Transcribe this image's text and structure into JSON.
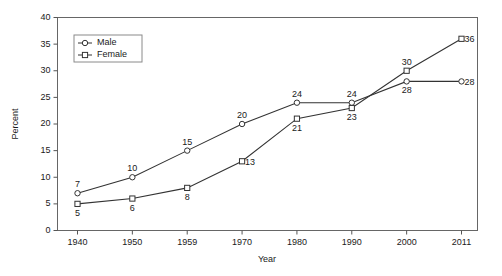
{
  "chart_data": {
    "type": "line",
    "title": "",
    "xlabel": "Year",
    "ylabel": "Percent",
    "categories": [
      "1940",
      "1950",
      "1959",
      "1970",
      "1980",
      "1990",
      "2000",
      "2011"
    ],
    "ylim": [
      0,
      40
    ],
    "yticks": [
      0,
      5,
      10,
      15,
      20,
      25,
      30,
      35,
      40
    ],
    "ytick_labels": [
      "0",
      "5",
      "10",
      "15",
      "20",
      "25",
      "30",
      "35",
      "40"
    ],
    "grid": false,
    "legend_position": "top-left",
    "series": [
      {
        "name": "Male",
        "marker": "circle",
        "values": [
          7,
          10,
          15,
          20,
          24,
          24,
          28,
          28
        ],
        "point_labels": [
          "7",
          "10",
          "15",
          "20",
          "24",
          "24",
          "28",
          "28"
        ],
        "label_side": [
          "above",
          "above",
          "above",
          "above",
          "above",
          "above",
          "below",
          "right"
        ]
      },
      {
        "name": "Female",
        "marker": "square",
        "values": [
          5,
          6,
          8,
          13,
          21,
          23,
          30,
          36
        ],
        "point_labels": [
          "5",
          "6",
          "8",
          "13",
          "21",
          "23",
          "30",
          "36"
        ],
        "label_side": [
          "below",
          "below",
          "below",
          "right",
          "below",
          "below",
          "above",
          "right"
        ]
      }
    ]
  },
  "legend": {
    "entries": [
      {
        "label": "Male"
      },
      {
        "label": "Female"
      }
    ]
  },
  "axes": {
    "y_title": "Percent",
    "x_title": "Year"
  }
}
